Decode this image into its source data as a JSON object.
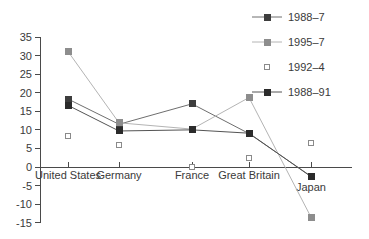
{
  "chart_data": {
    "type": "line",
    "title": "",
    "subtitle": "",
    "xlabel": "",
    "ylabel": "",
    "ylim": [
      -15,
      35
    ],
    "ytick_step": 5,
    "yticks": [
      35,
      30,
      25,
      20,
      15,
      10,
      5,
      0,
      -5,
      -10,
      -15
    ],
    "ytick_labels": [
      "35",
      "30",
      "25",
      "20",
      "15",
      "10",
      "5",
      "0",
      "-5",
      "-10",
      "-15"
    ],
    "categories": [
      "United States",
      "Germany",
      "France",
      "Great Britain",
      "Japan"
    ],
    "grid": false,
    "legend_position": "top-right",
    "series": [
      {
        "name": "1988–7",
        "marker": "filled-square",
        "marker_color": "#3d3d3d",
        "line_color": "#6e6e6e",
        "line": true,
        "values": [
          18.3,
          11.5,
          17.0,
          9.0,
          -2.5
        ]
      },
      {
        "name": "1995–7",
        "marker": "filled-square",
        "marker_color": "#8d8d8d",
        "line_color": "#b4b4b4",
        "line": true,
        "values": [
          31.1,
          11.9,
          10.2,
          18.7,
          -13.5
        ]
      },
      {
        "name": "1992–4",
        "marker": "open-square",
        "marker_color": "#ffffff",
        "line_color": "#c8c8c8",
        "line": false,
        "values": [
          8.4,
          5.9,
          0.1,
          2.3,
          6.5
        ]
      },
      {
        "name": "1988–91",
        "marker": "filled-square",
        "marker_color": "#2b2b2b",
        "line_color": "#545454",
        "line": true,
        "values": [
          16.6,
          9.7,
          10.0,
          9.1,
          -2.6
        ]
      }
    ]
  },
  "legend": {
    "entries": [
      {
        "label": "1988–7"
      },
      {
        "label": "1995–7"
      },
      {
        "label": "1992–4"
      },
      {
        "label": "1988–91"
      }
    ]
  },
  "colors": {
    "axis": "#4a4a4a",
    "text": "#3a3a3a",
    "background": "#ffffff"
  }
}
